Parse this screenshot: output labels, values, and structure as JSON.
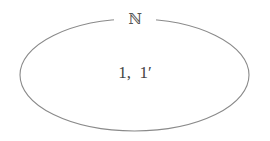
{
  "diagram": {
    "type": "set-venn",
    "set_label": "ℕ",
    "elements_text": "1,  1′",
    "elements": [
      "1",
      "1′"
    ],
    "stroke_color": "#8a8a8a",
    "text_color": "#444444"
  }
}
